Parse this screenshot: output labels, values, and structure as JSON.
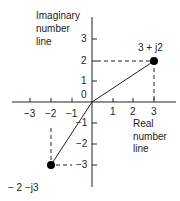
{
  "diagram": {
    "type": "complex-plane",
    "imag_axis_label": [
      "Imaginary",
      "number",
      "line"
    ],
    "real_axis_label": [
      "Real",
      "number",
      "line"
    ],
    "x_ticks": [
      {
        "value": -3,
        "label": "−3"
      },
      {
        "value": -2,
        "label": "−2"
      },
      {
        "value": -1,
        "label": "−1"
      },
      {
        "value": 1,
        "label": "1"
      },
      {
        "value": 2,
        "label": "2"
      },
      {
        "value": 3,
        "label": "3"
      }
    ],
    "y_ticks": [
      {
        "value": 3,
        "label": "3"
      },
      {
        "value": 2,
        "label": "2"
      },
      {
        "value": 1,
        "label": "1"
      },
      {
        "value": 0,
        "label": "0"
      },
      {
        "value": -1,
        "label": "−1"
      },
      {
        "value": -2,
        "label": "−2"
      },
      {
        "value": -3,
        "label": "−3"
      }
    ],
    "points": [
      {
        "re": 3,
        "im": 2,
        "label": "3 + j2"
      },
      {
        "re": -2,
        "im": -3,
        "label": "− 2 −j3"
      }
    ],
    "colors": {
      "axis": "#222222",
      "point": "#000000",
      "text": "#222222"
    }
  }
}
